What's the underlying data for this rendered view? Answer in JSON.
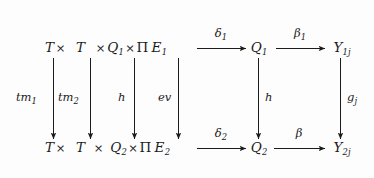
{
  "figure": {
    "kind": "commutative-diagram",
    "background_color": "#fdfdfd",
    "ink_color": "#1b1b1b"
  },
  "nodes": {
    "top_left_expr": {
      "t1": "T",
      "times1": "×",
      "t2": "T",
      "times2": "×",
      "q": "Q",
      "q_sub": "1",
      "times3": "×",
      "pi": "Π",
      "e": "E",
      "e_sub": "1"
    },
    "top_mid": {
      "base": "Q",
      "sub": "1"
    },
    "top_right": {
      "base": "Y",
      "sub": "1j"
    },
    "bottom_left_expr": {
      "t1": "T",
      "times1": "×",
      "t2": "T",
      "times2": "×",
      "q": "Q",
      "q_sub": "2",
      "times3": "×",
      "pi": "Π",
      "e": "E",
      "e_sub": "2"
    },
    "bottom_mid": {
      "base": "Q",
      "sub": "2"
    },
    "bottom_right": {
      "base": "Y",
      "sub": "2j"
    }
  },
  "arrows": {
    "top_delta": {
      "base": "δ",
      "sub": "1"
    },
    "top_beta": {
      "base": "β",
      "sub": "1"
    },
    "bottom_delta": {
      "base": "δ",
      "sub": "2"
    },
    "bottom_beta": {
      "base": "β",
      "sub": ""
    },
    "v_tm1": {
      "base": "tm",
      "sub": "1"
    },
    "v_tm2": {
      "base": "tm",
      "sub": "2"
    },
    "v_h_left": {
      "base": "h",
      "sub": ""
    },
    "v_ev": {
      "base": "ev",
      "sub": ""
    },
    "v_h_mid": {
      "base": "h",
      "sub": ""
    },
    "v_g": {
      "base": "g",
      "sub": "j"
    }
  }
}
